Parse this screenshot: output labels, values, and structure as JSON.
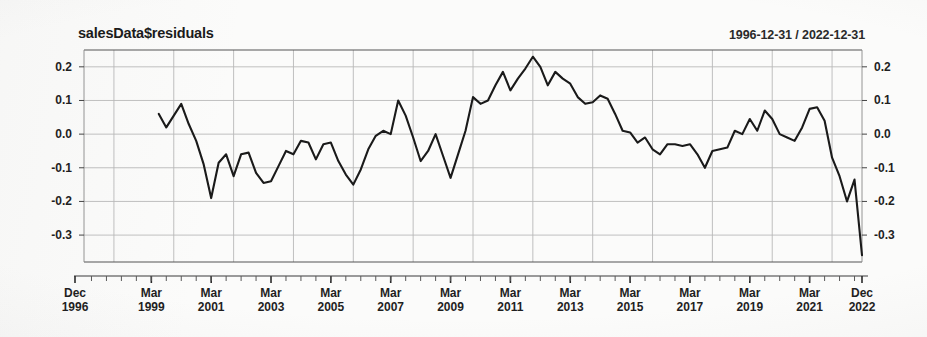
{
  "chart_data": {
    "type": "line",
    "title": "salesData$residuals",
    "subtitle": "1996-12-31 / 2022-12-31",
    "xlabel": "",
    "ylabel": "",
    "ylim": [
      -0.38,
      0.25
    ],
    "yticks": [
      0.2,
      0.1,
      0.0,
      -0.1,
      -0.2,
      -0.3
    ],
    "ytick_labels": [
      "0.2",
      "0.1",
      "0.0",
      "-0.1",
      "-0.2",
      "-0.3"
    ],
    "ytick_labels_right": [
      "0.2",
      "0.1",
      "0.0",
      "-0.1",
      "-0.2",
      "-0.3"
    ],
    "xtick_labels": [
      {
        "month": "Dec",
        "year": "1996"
      },
      {
        "month": "Mar",
        "year": "1999"
      },
      {
        "month": "Mar",
        "year": "2001"
      },
      {
        "month": "Mar",
        "year": "2003"
      },
      {
        "month": "Mar",
        "year": "2005"
      },
      {
        "month": "Mar",
        "year": "2007"
      },
      {
        "month": "Mar",
        "year": "2009"
      },
      {
        "month": "Mar",
        "year": "2011"
      },
      {
        "month": "Mar",
        "year": "2013"
      },
      {
        "month": "Mar",
        "year": "2015"
      },
      {
        "month": "Mar",
        "year": "2017"
      },
      {
        "month": "Mar",
        "year": "2019"
      },
      {
        "month": "Mar",
        "year": "2021"
      },
      {
        "month": "Dec",
        "year": "2022"
      }
    ],
    "xlim": [
      "1996-12-31",
      "2022-12-31"
    ],
    "grid": true,
    "legend": "none",
    "line_color": "#1a1a1a",
    "series": [
      {
        "name": "residuals",
        "x": [
          "1999-06-30",
          "1999-09-30",
          "1999-12-31",
          "2000-03-31",
          "2000-06-30",
          "2000-09-30",
          "2000-12-31",
          "2001-03-31",
          "2001-06-30",
          "2001-09-30",
          "2001-12-31",
          "2002-03-31",
          "2002-06-30",
          "2002-09-30",
          "2002-12-31",
          "2003-03-31",
          "2003-06-30",
          "2003-09-30",
          "2003-12-31",
          "2004-03-31",
          "2004-06-30",
          "2004-09-30",
          "2004-12-31",
          "2005-03-31",
          "2005-06-30",
          "2005-09-30",
          "2005-12-31",
          "2006-03-31",
          "2006-06-30",
          "2006-09-30",
          "2006-12-31",
          "2007-03-31",
          "2007-06-30",
          "2007-09-30",
          "2007-12-31",
          "2008-03-31",
          "2008-06-30",
          "2008-09-30",
          "2008-12-31",
          "2009-03-31",
          "2009-06-30",
          "2009-09-30",
          "2009-12-31",
          "2010-03-31",
          "2010-06-30",
          "2010-09-30",
          "2010-12-31",
          "2011-03-31",
          "2011-06-30",
          "2011-09-30",
          "2011-12-31",
          "2012-03-31",
          "2012-06-30",
          "2012-09-30",
          "2012-12-31",
          "2013-03-31",
          "2013-06-30",
          "2013-09-30",
          "2013-12-31",
          "2014-03-31",
          "2014-06-30",
          "2014-09-30",
          "2014-12-31",
          "2015-03-31",
          "2015-06-30",
          "2015-09-30",
          "2015-12-31",
          "2016-03-31",
          "2016-06-30",
          "2016-09-30",
          "2016-12-31",
          "2017-03-31",
          "2017-06-30",
          "2017-09-30",
          "2017-12-31",
          "2018-03-31",
          "2018-06-30",
          "2018-09-30",
          "2018-12-31",
          "2019-03-31",
          "2019-06-30",
          "2019-09-30",
          "2019-12-31",
          "2020-03-31",
          "2020-06-30",
          "2020-09-30",
          "2020-12-31",
          "2021-03-31",
          "2021-06-30",
          "2021-09-30",
          "2021-12-31",
          "2022-03-31",
          "2022-06-30",
          "2022-09-30",
          "2022-12-31"
        ],
        "values": [
          0.06,
          0.02,
          0.055,
          0.09,
          0.03,
          -0.02,
          -0.09,
          -0.19,
          -0.085,
          -0.06,
          -0.125,
          -0.06,
          -0.055,
          -0.115,
          -0.145,
          -0.14,
          -0.095,
          -0.05,
          -0.06,
          -0.02,
          -0.025,
          -0.075,
          -0.03,
          -0.025,
          -0.08,
          -0.12,
          -0.15,
          -0.105,
          -0.045,
          -0.005,
          0.01,
          0.0,
          0.1,
          0.055,
          -0.01,
          -0.08,
          -0.05,
          0.0,
          -0.065,
          -0.13,
          -0.06,
          0.01,
          0.11,
          0.09,
          0.1,
          0.145,
          0.185,
          0.13,
          0.165,
          0.195,
          0.23,
          0.2,
          0.145,
          0.185,
          0.165,
          0.15,
          0.11,
          0.09,
          0.095,
          0.115,
          0.105,
          0.06,
          0.01,
          0.005,
          -0.025,
          -0.01,
          -0.045,
          -0.06,
          -0.03,
          -0.03,
          -0.035,
          -0.03,
          -0.06,
          -0.1,
          -0.05,
          -0.045,
          -0.04,
          0.01,
          0.0,
          0.045,
          0.01,
          0.07,
          0.045,
          0.0,
          -0.01,
          -0.02,
          0.02,
          0.075,
          0.08,
          0.04,
          -0.07,
          -0.125,
          -0.2,
          -0.135,
          -0.36
        ]
      }
    ]
  }
}
